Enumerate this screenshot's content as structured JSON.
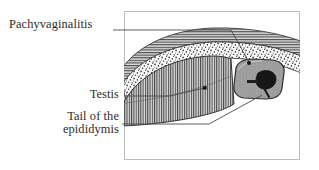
{
  "figure": {
    "type": "anatomical-illustration",
    "frame": {
      "x": 124,
      "y": 11,
      "width": 176,
      "height": 149,
      "border_color": "#b9b9b9"
    },
    "background_color": "#ffffff",
    "line_color": "#2b2b2b"
  },
  "labels": [
    {
      "id": "pachyvaginalitis",
      "text": "Pachyvaginalitis",
      "align": "left",
      "leader": "horizontal-then-diagonal-down-right",
      "target": "stippled tunica vaginalis layer"
    },
    {
      "id": "testis",
      "text": "Testis",
      "align": "right",
      "leader": "horizontal-then-diagonal-up-right",
      "target": "vertically hatched testis parenchyma"
    },
    {
      "id": "epididymis",
      "line1": "Tail of the",
      "line2": "epididymis",
      "align": "right",
      "leader": "horizontal-then-diagonal-up-right",
      "target": "gray rounded epididymal tail mass"
    }
  ],
  "structures": [
    {
      "id": "outer-band",
      "name": "thickened parietal layer",
      "texture": "horizontal-hatching",
      "fill": "#d8d8d8",
      "stroke": "#3a3a3a"
    },
    {
      "id": "stipple-band",
      "name": "tunica vaginalis - stippled exudate layer",
      "texture": "stipple",
      "fill": "#fefefe",
      "stroke": "#3a3a3a"
    },
    {
      "id": "testis-body",
      "name": "testis",
      "texture": "vertical-hatching",
      "fill": "#cfcfcf",
      "stroke": "#333333"
    },
    {
      "id": "epididymis-tail",
      "name": "tail of the epididymis",
      "texture": "solid-gray",
      "fill": "#9a9a9a",
      "stroke": "#2b2b2b"
    },
    {
      "id": "epididymal-duct",
      "name": "coiled epididymal duct",
      "texture": "solid-dark",
      "fill": "#1a1a1a",
      "stroke": "#111111"
    }
  ],
  "markers": [
    {
      "id": "pachyvaginalitis-dot",
      "x": 249,
      "y": 63,
      "r": 2.0,
      "color": "#1a1a1a"
    },
    {
      "id": "testis-dot",
      "x": 205,
      "y": 88,
      "r": 1.9,
      "color": "#1a1a1a"
    }
  ]
}
